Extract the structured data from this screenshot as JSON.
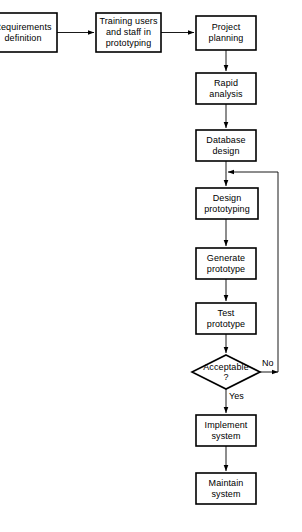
{
  "diagram": {
    "type": "flowchart",
    "colors": {
      "background": "#ffffff",
      "stroke": "#000000",
      "text": "#000000"
    },
    "nodes": [
      {
        "id": "requirements-definition",
        "shape": "rectangle",
        "label": "Requirements\ndefinition",
        "x": -11,
        "y": 13,
        "w": 68,
        "h": 39
      },
      {
        "id": "training-users",
        "shape": "rectangle",
        "label": "Training users\nand staff in\nprototyping",
        "x": 96,
        "y": 13,
        "w": 65,
        "h": 39
      },
      {
        "id": "project-planning",
        "shape": "rectangle",
        "label": "Project\nplanning",
        "x": 196,
        "y": 16,
        "w": 60,
        "h": 34
      },
      {
        "id": "rapid-analysis",
        "shape": "rectangle",
        "label": "Rapid\nanalysis",
        "x": 196,
        "y": 73,
        "w": 60,
        "h": 31
      },
      {
        "id": "database-design",
        "shape": "rectangle",
        "label": "Database\ndesign",
        "x": 196,
        "y": 130,
        "w": 60,
        "h": 31
      },
      {
        "id": "design-prototyping",
        "shape": "rectangle",
        "label": "Design\nprototyping",
        "x": 196,
        "y": 188,
        "w": 62,
        "h": 31
      },
      {
        "id": "generate-prototype",
        "shape": "rectangle",
        "label": "Generate\nprototype",
        "x": 196,
        "y": 248,
        "w": 60,
        "h": 31
      },
      {
        "id": "test-prototype",
        "shape": "rectangle",
        "label": "Test\nprototype",
        "x": 196,
        "y": 303,
        "w": 60,
        "h": 31
      },
      {
        "id": "acceptable-decision",
        "shape": "diamond",
        "label": "Acceptable\n?",
        "x": 192,
        "y": 355,
        "w": 68,
        "h": 34
      },
      {
        "id": "implement-system",
        "shape": "rectangle",
        "label": "Implement\nsystem",
        "x": 196,
        "y": 415,
        "w": 60,
        "h": 31
      },
      {
        "id": "maintain-system",
        "shape": "rectangle",
        "label": "Maintain\nsystem",
        "x": 196,
        "y": 473,
        "w": 60,
        "h": 31
      }
    ],
    "edge_labels": [
      {
        "id": "no-branch-label",
        "text": "No",
        "x": 262,
        "y": 358
      },
      {
        "id": "yes-branch-label",
        "text": "Yes",
        "x": 229,
        "y": 391
      }
    ],
    "edges": [
      {
        "id": "requirements-to-training",
        "from": "requirements-definition",
        "to": "training-users"
      },
      {
        "id": "training-to-planning",
        "from": "training-users",
        "to": "project-planning"
      },
      {
        "id": "planning-to-rapid-analysis",
        "from": "project-planning",
        "to": "rapid-analysis"
      },
      {
        "id": "rapid-analysis-to-database-design",
        "from": "rapid-analysis",
        "to": "database-design"
      },
      {
        "id": "database-design-to-design-prototyping",
        "from": "database-design",
        "to": "design-prototyping"
      },
      {
        "id": "design-prototyping-to-generate-prototype",
        "from": "design-prototyping",
        "to": "generate-prototype"
      },
      {
        "id": "generate-prototype-to-test-prototype",
        "from": "generate-prototype",
        "to": "test-prototype"
      },
      {
        "id": "test-prototype-to-acceptable",
        "from": "test-prototype",
        "to": "acceptable-decision"
      },
      {
        "id": "acceptable-no-loopback",
        "from": "acceptable-decision",
        "to": "design-prototyping",
        "label": "No"
      },
      {
        "id": "acceptable-yes-to-implement",
        "from": "acceptable-decision",
        "to": "implement-system",
        "label": "Yes"
      },
      {
        "id": "implement-to-maintain",
        "from": "implement-system",
        "to": "maintain-system"
      }
    ]
  }
}
